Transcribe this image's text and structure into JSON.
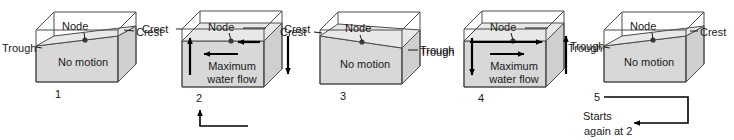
{
  "diagram": {
    "colors": {
      "water_fill": "#d8d8d8",
      "surface_fill": "#e6e6e6",
      "box_stroke": "#4c4c4c",
      "text": "#1a1a1a",
      "arrow": "#000000"
    },
    "panels": [
      {
        "number": "1",
        "state": "no-motion",
        "tilt": "down-left",
        "node_label": "Node",
        "body_label": "No motion",
        "left_label": "Trough",
        "right_label": "Crest",
        "arrows": []
      },
      {
        "number": "2",
        "state": "maximum-flow",
        "tilt": "level",
        "node_label": "Node",
        "body_label": "Maximum\nwater flow",
        "body_label_line1": "Maximum",
        "body_label_line2": "water flow",
        "left_label": "Crest",
        "right_label": "Crest",
        "arrows": [
          "left-side-up",
          "right-side-down",
          "flow-left-upper",
          "flow-left-lower"
        ]
      },
      {
        "number": "3",
        "state": "no-motion",
        "tilt": "down-right",
        "node_label": "Node",
        "body_label": "No motion",
        "left_label": "Crest",
        "right_label": "Trough",
        "arrows": []
      },
      {
        "number": "4",
        "state": "maximum-flow",
        "tilt": "level",
        "node_label": "Node",
        "body_label": "Maximum\nwater flow",
        "body_label_line1": "Maximum",
        "body_label_line2": "water flow",
        "left_label": "Trough",
        "right_label": "Trough",
        "arrows": [
          "left-side-down",
          "right-side-up",
          "flow-right-upper",
          "flow-right-lower"
        ]
      },
      {
        "number": "5",
        "state": "no-motion",
        "tilt": "down-left",
        "node_label": "Node",
        "body_label": "No motion",
        "left_label": "Trough",
        "right_label": "Crest",
        "arrows": []
      }
    ],
    "loop": {
      "caption_line1": "Starts",
      "caption_line2": "again at 2",
      "from_panel": "5",
      "to_panel": "2"
    }
  }
}
